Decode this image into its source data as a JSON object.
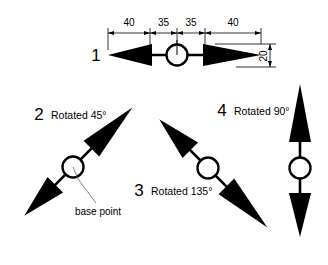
{
  "diagram": {
    "background_color": "#ffffff",
    "ink_color": "#000000",
    "leader_color": "#5a6472"
  },
  "dimensions": {
    "seg_1": "40",
    "seg_2": "35",
    "seg_3": "35",
    "seg_4": "40",
    "height": "20"
  },
  "symbols": [
    {
      "number": "1",
      "rotation_label": "",
      "angle_deg": 0
    },
    {
      "number": "2",
      "rotation_label": "Rotated 45°",
      "angle_deg": 45
    },
    {
      "number": "3",
      "rotation_label": "Rotated 135°",
      "angle_deg": 135
    },
    {
      "number": "4",
      "rotation_label": "Rotated 90°",
      "angle_deg": 90
    }
  ],
  "annotations": {
    "base_point": "base point"
  }
}
